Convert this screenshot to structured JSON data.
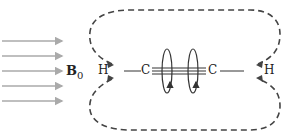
{
  "diagram": {
    "field_label": "B",
    "field_subscript": "0",
    "atoms": {
      "h_left": "H",
      "c_left": "C",
      "c_right": "C",
      "h_right": "H"
    },
    "arrow_count": 5,
    "colors": {
      "field_arrows": "#aaaaaa",
      "lines": "#333333",
      "dashed_field_lines": "#444444"
    }
  }
}
